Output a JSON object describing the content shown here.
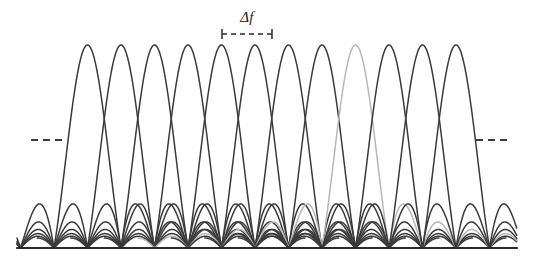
{
  "figure": {
    "title_visible": false,
    "background_color": "#ffffff",
    "width": 533,
    "height": 263
  },
  "annotations": {
    "spacing_label": "Δf",
    "spacing_label_x": 247,
    "spacing_label_y": 10,
    "measure_bar": {
      "name": "delta-f-measure-bar",
      "x_start": 222,
      "x_end": 272,
      "y": 34,
      "tick_half_height": 5,
      "dash_pattern": "5,4",
      "color": "#2b2b2b"
    },
    "left_ellipsis": {
      "name": "left-continuation-dashes",
      "x_start": 31,
      "x_end": 62,
      "y": 140,
      "dash_pattern": "7,5",
      "color": "#3a3a3a"
    },
    "right_ellipsis": {
      "name": "right-continuation-dashes",
      "x_start": 476,
      "x_end": 509,
      "y": 140,
      "dash_pattern": "7,5",
      "color": "#3a3a3a"
    }
  },
  "chart_data": {
    "type": "line",
    "title": "",
    "subtitle": "",
    "xlabel": "",
    "ylabel": "",
    "legend": [],
    "legend_position": "none",
    "grid": false,
    "axis_visible": {
      "x": true,
      "y": false
    },
    "xlim": [
      17,
      517
    ],
    "ylim": [
      0,
      1
    ],
    "baseline_y_px": 248,
    "peak_y_px": 45,
    "x_axis": {
      "name": "frequency-axis",
      "x_start": 17,
      "x_end": 517,
      "y": 248,
      "color": "#2b2b2b",
      "width": 2.2
    },
    "subcarrier_spacing_px": 33.5,
    "lobe_half_width_px": 33.5,
    "sidelobe_count_each_side": 6,
    "series": [
      {
        "name": "subcarrier-1",
        "index": 1,
        "center_px": 87.5,
        "peak_value": 1,
        "color": "#3a3a3a",
        "highlighted": false
      },
      {
        "name": "subcarrier-2",
        "index": 2,
        "center_px": 121.0,
        "peak_value": 1,
        "color": "#3a3a3a",
        "highlighted": false
      },
      {
        "name": "subcarrier-3",
        "index": 3,
        "center_px": 154.5,
        "peak_value": 1,
        "color": "#3a3a3a",
        "highlighted": false
      },
      {
        "name": "subcarrier-4",
        "index": 4,
        "center_px": 188.0,
        "peak_value": 1,
        "color": "#3a3a3a",
        "highlighted": false
      },
      {
        "name": "subcarrier-5",
        "index": 5,
        "center_px": 221.5,
        "peak_value": 1,
        "color": "#3a3a3a",
        "highlighted": false
      },
      {
        "name": "subcarrier-6",
        "index": 6,
        "center_px": 255.0,
        "peak_value": 1,
        "color": "#3a3a3a",
        "highlighted": false
      },
      {
        "name": "subcarrier-7",
        "index": 7,
        "center_px": 288.5,
        "peak_value": 1,
        "color": "#3a3a3a",
        "highlighted": false
      },
      {
        "name": "subcarrier-8",
        "index": 8,
        "center_px": 322.0,
        "peak_value": 1,
        "color": "#3a3a3a",
        "highlighted": false
      },
      {
        "name": "subcarrier-9",
        "index": 9,
        "center_px": 355.5,
        "peak_value": 1,
        "color": "#b8b8b8",
        "highlighted": true
      },
      {
        "name": "subcarrier-10",
        "index": 10,
        "center_px": 389.0,
        "peak_value": 1,
        "color": "#3a3a3a",
        "highlighted": false
      },
      {
        "name": "subcarrier-11",
        "index": 11,
        "center_px": 422.5,
        "peak_value": 1,
        "color": "#3a3a3a",
        "highlighted": false
      },
      {
        "name": "subcarrier-12",
        "index": 12,
        "center_px": 456.0,
        "peak_value": 1,
        "color": "#3a3a3a",
        "highlighted": false
      }
    ],
    "visible_peak_centers_px": [
      87.5,
      121.0,
      154.5,
      188.0,
      221.5,
      255.0,
      288.5,
      322.0,
      355.5,
      389.0,
      422.5,
      456.0
    ],
    "curve_stroke_width": 1.5
  }
}
